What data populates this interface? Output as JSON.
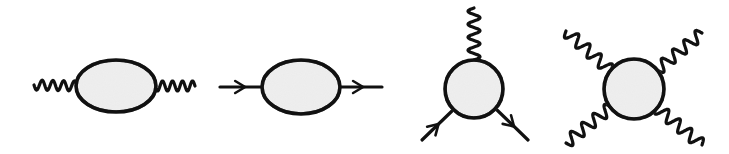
{
  "figure": {
    "colors": {
      "stroke": "#111111",
      "blob_fill": "#ebebeb",
      "background": "#ffffff"
    },
    "diagrams": [
      {
        "id": "photon-self-energy",
        "label": "Two-point blob with wavy (photon) legs",
        "blob": {
          "shape": "ellipse",
          "cx": 116,
          "cy": 86,
          "rx": 40,
          "ry": 26
        },
        "legs": [
          {
            "type": "wavy",
            "from": [
              34,
              85
            ],
            "to": [
              77,
              86
            ],
            "waves": 4,
            "amp": 5
          },
          {
            "type": "wavy",
            "from": [
              155,
              86
            ],
            "to": [
              195,
              86
            ],
            "waves": 4,
            "amp": 5
          }
        ]
      },
      {
        "id": "fermion-self-energy",
        "label": "Two-point blob with straight arrowed (fermion) legs",
        "blob": {
          "shape": "ellipse",
          "cx": 301,
          "cy": 87,
          "rx": 39,
          "ry": 27
        },
        "legs": [
          {
            "type": "arrow",
            "from": [
              220,
              87
            ],
            "to": [
              262,
              87
            ],
            "arrow_at": 0.6
          },
          {
            "type": "arrow",
            "from": [
              340,
              87
            ],
            "to": [
              382,
              87
            ],
            "arrow_at": 0.55
          }
        ]
      },
      {
        "id": "three-point-vertex",
        "label": "Three-point blob: one wavy leg, two arrowed fermion legs",
        "blob": {
          "shape": "circle",
          "cx": 474,
          "cy": 89,
          "r": 29
        },
        "legs": [
          {
            "type": "wavy",
            "from": [
              474,
              60
            ],
            "to": [
              474,
              8
            ],
            "waves": 4,
            "amp": 6
          },
          {
            "type": "arrow",
            "from": [
              422,
              140
            ],
            "to": [
              452,
              111
            ],
            "arrow_at": 0.55
          },
          {
            "type": "arrow",
            "from": [
              497,
              110
            ],
            "to": [
              528,
              140
            ],
            "arrow_at": 0.55
          }
        ]
      },
      {
        "id": "four-point-vertex",
        "label": "Four-point blob with four wavy legs",
        "blob": {
          "shape": "circle",
          "cx": 634,
          "cy": 89,
          "r": 30
        },
        "legs": [
          {
            "type": "wavy",
            "from": [
              611,
              71
            ],
            "to": [
              566,
              31
            ],
            "waves": 4,
            "amp": 6
          },
          {
            "type": "wavy",
            "from": [
              657,
              70
            ],
            "to": [
              702,
              33
            ],
            "waves": 4,
            "amp": 6
          },
          {
            "type": "wavy",
            "from": [
              611,
              107
            ],
            "to": [
              566,
              143
            ],
            "waves": 4,
            "amp": 6
          },
          {
            "type": "wavy",
            "from": [
              656,
              107
            ],
            "to": [
              702,
              145
            ],
            "waves": 4,
            "amp": 6
          }
        ]
      }
    ]
  }
}
